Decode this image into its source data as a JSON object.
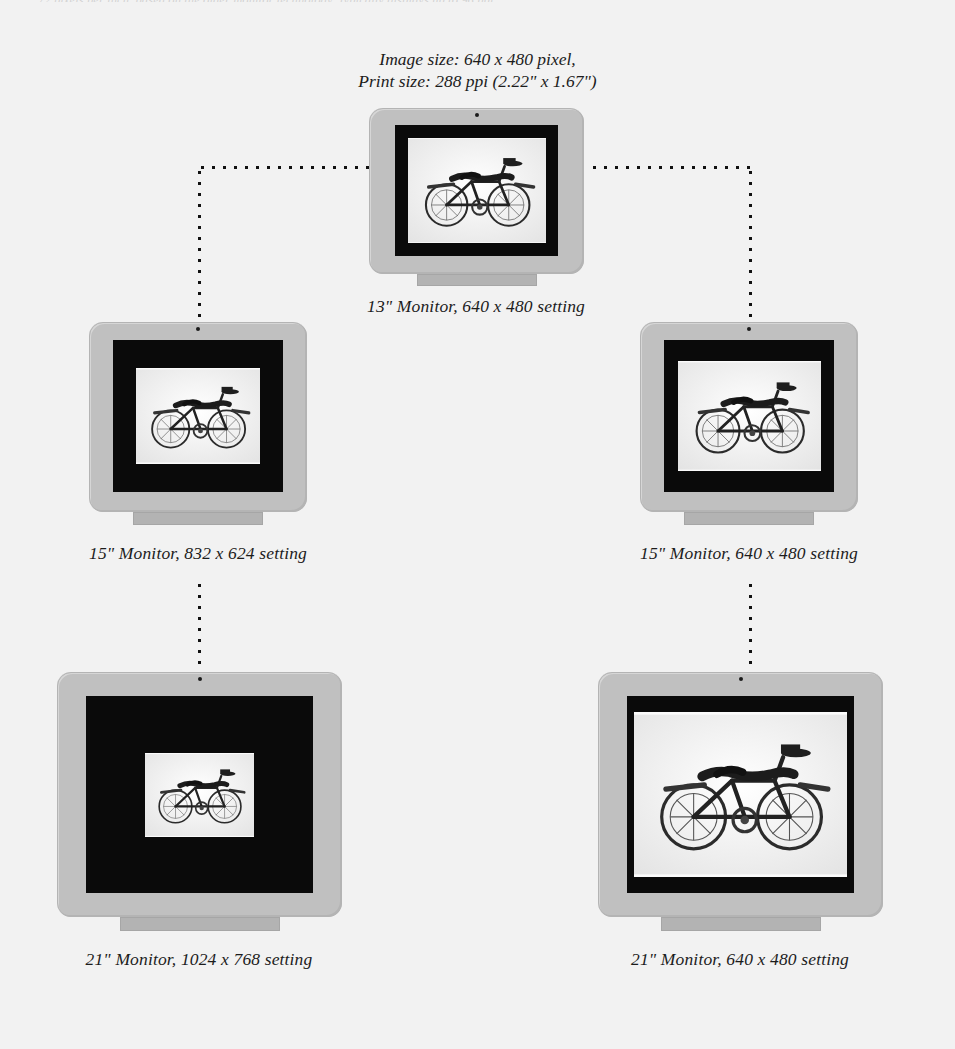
{
  "page": {
    "background_color": "#f2f2f2",
    "running_head_text": "72 pixels per inch, based on the older monitor technology; typically displays up to 96 ppi"
  },
  "header": {
    "line1": "Image size: 640 x 480 pixel,",
    "line2": "Print size: 288 ppi (2.22\" x 1.67\")"
  },
  "monitors": [
    {
      "id": "monitor-13in",
      "caption": "13\" Monitor, 640 x 480 setting",
      "size_label": "13\"",
      "setting": "640 x 480",
      "bezel_color": "#c0c0c0",
      "screen_color": "#0a0a0a",
      "photo_color": "#fbfbfb",
      "photo_alt": "black-and-white photograph of a vintage bicycle"
    },
    {
      "id": "monitor-15in-832",
      "caption": "15\" Monitor, 832 x 624 setting",
      "size_label": "15\"",
      "setting": "832 x 624",
      "bezel_color": "#c0c0c0",
      "screen_color": "#0a0a0a",
      "photo_color": "#fbfbfb",
      "photo_alt": "black-and-white photograph of a vintage bicycle"
    },
    {
      "id": "monitor-15in-640",
      "caption": "15\" Monitor, 640 x 480 setting",
      "size_label": "15\"",
      "setting": "640 x 480",
      "bezel_color": "#c0c0c0",
      "screen_color": "#0a0a0a",
      "photo_color": "#fbfbfb",
      "photo_alt": "black-and-white photograph of a vintage bicycle"
    },
    {
      "id": "monitor-21in-1024",
      "caption": "21\" Monitor, 1024 x 768 setting",
      "size_label": "21\"",
      "setting": "1024 x 768",
      "bezel_color": "#c0c0c0",
      "screen_color": "#0a0a0a",
      "photo_color": "#fbfbfb",
      "photo_alt": "black-and-white photograph of a vintage bicycle"
    },
    {
      "id": "monitor-21in-640",
      "caption": "21\" Monitor, 640 x 480 setting",
      "size_label": "21\"",
      "setting": "640 x 480",
      "bezel_color": "#c0c0c0",
      "screen_color": "#0a0a0a",
      "photo_color": "#fbfbfb",
      "photo_alt": "black-and-white photograph of a vintage bicycle"
    }
  ]
}
